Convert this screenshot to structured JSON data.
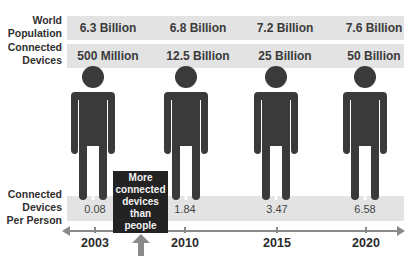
{
  "rows": {
    "world_population": {
      "label_line1": "World",
      "label_line2": "Population",
      "values": [
        "6.3 Billion",
        "6.8 Billion",
        "7.2 Billion",
        "7.6 Billion"
      ]
    },
    "connected_devices": {
      "label_line1": "Connected",
      "label_line2": "Devices",
      "values": [
        "500 Million",
        "12.5 Billion",
        "25 Billion",
        "50 Billion"
      ]
    },
    "devices_per_person": {
      "label_line1": "Connected",
      "label_line2": "Devices",
      "label_line3": "Per Person",
      "values": [
        "0.08",
        "1.84",
        "3.47",
        "6.58"
      ]
    }
  },
  "timeline": {
    "years": [
      "2003",
      "2010",
      "2015",
      "2020"
    ]
  },
  "callout": {
    "line1": "More",
    "line2": "connected",
    "line3": "devices",
    "line4": "than",
    "line5": "people"
  },
  "colors": {
    "band": "#e3e3e3",
    "figure": "#3a3a3a",
    "callout_bg": "#232323",
    "axis": "#8a8a8a"
  }
}
